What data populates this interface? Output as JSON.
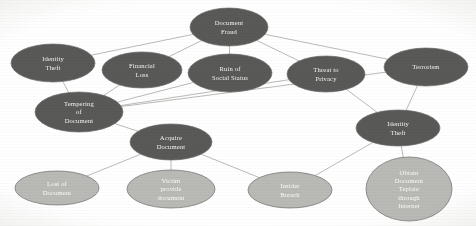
{
  "diagram": {
    "type": "attack-tree",
    "canvas": {
      "width": 476,
      "height": 226
    },
    "palette": {
      "node_dark": "#595957",
      "node_light": "#b9b9b5",
      "edge": "#a8a8a4",
      "label_text": "#f2f2f0",
      "background": "#ffffff"
    },
    "nodes": [
      {
        "id": "document-fraud",
        "label": "Document Fraud",
        "lines": [
          "Document",
          "Fraud"
        ],
        "cx": 229,
        "cy": 27,
        "rx": 39,
        "ry": 19,
        "tier": "root",
        "shade": "dark"
      },
      {
        "id": "identity-theft-left",
        "label": "Identity Theft",
        "lines": [
          "Identity",
          "Theft"
        ],
        "cx": 53,
        "cy": 63,
        "rx": 42,
        "ry": 19,
        "tier": "impact",
        "shade": "dark"
      },
      {
        "id": "financial-loss",
        "label": "Financial Loss",
        "lines": [
          "Financial",
          "Loss"
        ],
        "cx": 142,
        "cy": 70,
        "rx": 40,
        "ry": 18,
        "tier": "impact",
        "shade": "dark"
      },
      {
        "id": "ruin-of-social-status",
        "label": "Ruin of Social Status",
        "lines": [
          "Ruin of",
          "Social Status"
        ],
        "cx": 230,
        "cy": 73,
        "rx": 42,
        "ry": 19,
        "tier": "impact",
        "shade": "dark"
      },
      {
        "id": "threat-to-privacy",
        "label": "Threat to Privacy",
        "lines": [
          "Threat to",
          "Privacy"
        ],
        "cx": 326,
        "cy": 74,
        "rx": 39,
        "ry": 18,
        "tier": "impact",
        "shade": "dark"
      },
      {
        "id": "terrorism",
        "label": "Terrorism",
        "lines": [
          "Terrorism"
        ],
        "cx": 426,
        "cy": 67,
        "rx": 42,
        "ry": 19,
        "tier": "impact",
        "shade": "dark"
      },
      {
        "id": "tempering-of-document",
        "label": "Tempering of Document",
        "lines": [
          "Tempering",
          "of",
          "Document"
        ],
        "cx": 79,
        "cy": 112,
        "rx": 44,
        "ry": 20,
        "tier": "method",
        "shade": "dark"
      },
      {
        "id": "acquire-document",
        "label": "Acquire Document",
        "lines": [
          "Acquire",
          "Document"
        ],
        "cx": 171,
        "cy": 142,
        "rx": 41,
        "ry": 18,
        "tier": "method",
        "shade": "dark"
      },
      {
        "id": "identity-theft-right",
        "label": "Identity Theft",
        "lines": [
          "Identity",
          "Theft"
        ],
        "cx": 398,
        "cy": 128,
        "rx": 42,
        "ry": 18,
        "tier": "method",
        "shade": "dark"
      },
      {
        "id": "lost-of-document",
        "label": "Lost of Document",
        "lines": [
          "Lost of",
          "Document"
        ],
        "cx": 57,
        "cy": 188,
        "rx": 42,
        "ry": 17,
        "tier": "leaf",
        "shade": "light"
      },
      {
        "id": "victim-provide-document",
        "label": "Victim provide document",
        "lines": [
          "Victim",
          "provide",
          "document"
        ],
        "cx": 171,
        "cy": 189,
        "rx": 44,
        "ry": 19,
        "tier": "leaf",
        "shade": "light"
      },
      {
        "id": "insider-breach",
        "label": "Insider Breach",
        "lines": [
          "Insider",
          "Breach"
        ],
        "cx": 290,
        "cy": 190,
        "rx": 42,
        "ry": 18,
        "tier": "leaf",
        "shade": "light"
      },
      {
        "id": "obtain-document-teplate-through-internet",
        "label": "Obtain Document Teplate through Internet",
        "lines": [
          "Obtain",
          "Document",
          "Teplate",
          "through",
          "Internet"
        ],
        "cx": 409,
        "cy": 189,
        "rx": 43,
        "ry": 32,
        "tier": "leaf",
        "shade": "light"
      }
    ],
    "edges": [
      {
        "from": "identity-theft-left",
        "to": "document-fraud"
      },
      {
        "from": "financial-loss",
        "to": "document-fraud"
      },
      {
        "from": "ruin-of-social-status",
        "to": "document-fraud"
      },
      {
        "from": "threat-to-privacy",
        "to": "document-fraud"
      },
      {
        "from": "terrorism",
        "to": "document-fraud"
      },
      {
        "from": "tempering-of-document",
        "to": "identity-theft-left"
      },
      {
        "from": "tempering-of-document",
        "to": "financial-loss"
      },
      {
        "from": "tempering-of-document",
        "to": "ruin-of-social-status"
      },
      {
        "from": "tempering-of-document",
        "to": "threat-to-privacy"
      },
      {
        "from": "tempering-of-document",
        "to": "terrorism"
      },
      {
        "from": "acquire-document",
        "to": "tempering-of-document"
      },
      {
        "from": "lost-of-document",
        "to": "acquire-document"
      },
      {
        "from": "victim-provide-document",
        "to": "acquire-document"
      },
      {
        "from": "insider-breach",
        "to": "acquire-document"
      },
      {
        "from": "identity-theft-right",
        "to": "threat-to-privacy"
      },
      {
        "from": "identity-theft-right",
        "to": "terrorism"
      },
      {
        "from": "insider-breach",
        "to": "identity-theft-right"
      },
      {
        "from": "obtain-document-teplate-through-internet",
        "to": "identity-theft-right"
      }
    ]
  }
}
